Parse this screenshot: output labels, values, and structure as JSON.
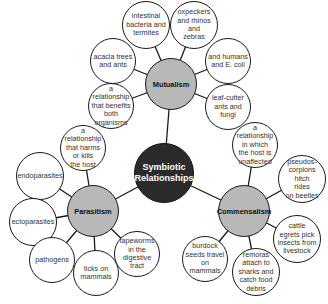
{
  "diagram": {
    "title": "Symbiotic Relationships",
    "center": {
      "label": "Symbiotic\nRelationships",
      "x": 164,
      "y": 173,
      "r": 30,
      "color": "#2b2b2b"
    },
    "hub_color": "#b8b8b8",
    "hubs": [
      {
        "id": "mutualism",
        "label": "Mutualism",
        "x": 171,
        "y": 84,
        "r": 26,
        "children": [
          {
            "label": "intestinal\nbacteria and\ntermites",
            "x": 146,
            "y": 25,
            "r": 24
          },
          {
            "label": "oxpeckers\nand rhinos and\nzebras",
            "x": 194,
            "y": 25,
            "r": 24
          },
          {
            "label": "acacia trees\nand ants",
            "x": 113,
            "y": 61,
            "r": 23
          },
          {
            "label": "and humans\nand E. coli",
            "x": 228,
            "y": 61,
            "r": 23
          },
          {
            "label": "a relationship\nthat benefits\nboth\norganisms",
            "x": 111,
            "y": 106,
            "r": 23
          },
          {
            "label": "leaf-cutter\nants and fungi",
            "x": 228,
            "y": 107,
            "r": 23
          }
        ]
      },
      {
        "id": "parasitism",
        "label": "Parasitism",
        "x": 93,
        "y": 211,
        "r": 26,
        "children": [
          {
            "label": "a relationship\nthat harms\nor kills\nthe host",
            "x": 83,
            "y": 148,
            "r": 23
          },
          {
            "label": "endoparasites",
            "x": 40,
            "y": 176,
            "r": 24
          },
          {
            "label": "ectoparasites",
            "x": 33,
            "y": 222,
            "r": 24
          },
          {
            "label": "pathogens",
            "x": 52,
            "y": 260,
            "r": 23
          },
          {
            "label": "ticks on\nmammals",
            "x": 96,
            "y": 273,
            "r": 23
          },
          {
            "label": "tapeworms\nin the digestive\ntract",
            "x": 137,
            "y": 254,
            "r": 23
          }
        ]
      },
      {
        "id": "commensalism",
        "label": "Commensalism",
        "x": 244,
        "y": 211,
        "r": 26,
        "children": [
          {
            "label": "a relationship\nin which\nthe host is\nunaffected",
            "x": 255,
            "y": 145,
            "r": 23
          },
          {
            "label": "pseudos-\ncorpions hitch\nrides\non beetles",
            "x": 302,
            "y": 179,
            "r": 24
          },
          {
            "label": "cattle\negrets pick\ninsects from\nlivestock",
            "x": 297,
            "y": 239,
            "r": 24
          },
          {
            "label": "remoras\nattach to\nsharks and\ncatch food\ndebris",
            "x": 256,
            "y": 272,
            "r": 24
          },
          {
            "label": "burdock\nseeds travel on\nmammals",
            "x": 205,
            "y": 259,
            "r": 23
          }
        ]
      }
    ]
  }
}
